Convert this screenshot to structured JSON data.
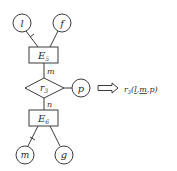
{
  "diagram": {
    "entities": [
      {
        "id": "E5",
        "label": "E",
        "subscript": "5"
      },
      {
        "id": "E6",
        "label": "E",
        "subscript": "6"
      }
    ],
    "relationship": {
      "id": "r3",
      "label": "r",
      "subscript": "3"
    },
    "attributes": [
      {
        "id": "l",
        "label": "l",
        "of": "E5",
        "key": true
      },
      {
        "id": "f",
        "label": "f",
        "of": "E5",
        "key": false
      },
      {
        "id": "p",
        "label": "p",
        "of": "r3",
        "key": false
      },
      {
        "id": "m",
        "label": "m",
        "of": "E6",
        "key": true
      },
      {
        "id": "g",
        "label": "g",
        "of": "E6",
        "key": false
      }
    ],
    "cardinalities": {
      "E5_r3": "m",
      "E6_r3": "n"
    },
    "arrow": "⟹",
    "result": {
      "name": "r",
      "subscript": "3",
      "open": "(",
      "params": [
        {
          "text": "l",
          "underline": true
        },
        {
          "text": "m",
          "underline": true
        },
        {
          "text": "p",
          "underline": false
        }
      ],
      "separator": ",",
      "close": ")"
    }
  }
}
